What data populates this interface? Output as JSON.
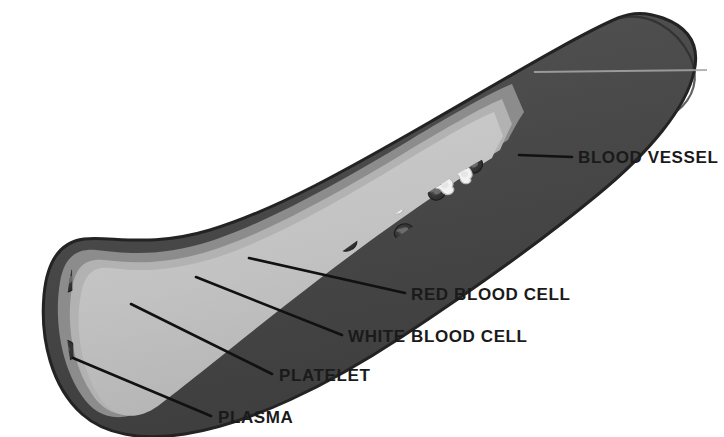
{
  "diagram": {
    "background_color": "#ffffff",
    "colors": {
      "vessel_wall_outer": "#4a4a4a",
      "vessel_wall_outline": "#2b2b2b",
      "vessel_wall_mid": "#8e8e8e",
      "vessel_wall_inner_ring": "#b0b0b0",
      "plasma_lumen": "#c2c2c2",
      "red_blood_cell": "#2d2d2d",
      "red_blood_cell_center": "#6e6e6e",
      "white_blood_cell": "#f2f2f2",
      "white_blood_cell_outline": "#b8b8b8",
      "platelet": "#555555",
      "label_text": "#1a1a1a",
      "leader_line": "#111111"
    },
    "labels": [
      {
        "id": "blood-vessel",
        "text": "BLOOD VESSEL",
        "text_x": 578,
        "text_y": 163,
        "anchor": "start",
        "leader": {
          "x1": 519,
          "y1": 155,
          "x2": 572,
          "y2": 157
        }
      },
      {
        "id": "red-blood-cell",
        "text": "RED BLOOD CELL",
        "text_x": 411,
        "text_y": 300,
        "anchor": "start",
        "leader": {
          "x1": 249,
          "y1": 258,
          "x2": 405,
          "y2": 293
        }
      },
      {
        "id": "white-blood-cell",
        "text": "WHITE BLOOD CELL",
        "text_x": 348,
        "text_y": 342,
        "anchor": "start",
        "leader": {
          "x1": 196,
          "y1": 277,
          "x2": 342,
          "y2": 335
        }
      },
      {
        "id": "platelet",
        "text": "PLATELET",
        "text_x": 279,
        "text_y": 381,
        "anchor": "start",
        "leader": {
          "x1": 131,
          "y1": 304,
          "x2": 272,
          "y2": 374
        }
      },
      {
        "id": "plasma",
        "text": "PLASMA",
        "text_x": 218,
        "text_y": 423,
        "anchor": "start",
        "leader": {
          "x1": 73,
          "y1": 358,
          "x2": 211,
          "y2": 416
        }
      }
    ],
    "cells": {
      "red_blood_cells": [
        {
          "cx": 32,
          "cy": 323,
          "rx": 15,
          "ry": 12,
          "rot": -22
        },
        {
          "cx": 66,
          "cy": 281,
          "rx": 14,
          "ry": 11,
          "rot": -18
        },
        {
          "cx": 63,
          "cy": 351,
          "rx": 13,
          "ry": 11,
          "rot": -10
        },
        {
          "cx": 101,
          "cy": 307,
          "rx": 13,
          "ry": 11,
          "rot": -14
        },
        {
          "cx": 97,
          "cy": 390,
          "rx": 13,
          "ry": 11,
          "rot": -6
        },
        {
          "cx": 155,
          "cy": 267,
          "rx": 12,
          "ry": 10,
          "rot": -20
        },
        {
          "cx": 170,
          "cy": 325,
          "rx": 12,
          "ry": 10,
          "rot": -8
        },
        {
          "cx": 231,
          "cy": 249,
          "rx": 11,
          "ry": 9,
          "rot": -24
        },
        {
          "cx": 249,
          "cy": 258,
          "rx": 10,
          "ry": 9,
          "rot": -16
        },
        {
          "cx": 296,
          "cy": 220,
          "rx": 11,
          "ry": 9,
          "rot": -26
        },
        {
          "cx": 345,
          "cy": 215,
          "rx": 10,
          "ry": 9,
          "rot": -24
        },
        {
          "cx": 347,
          "cy": 243,
          "rx": 10,
          "ry": 8,
          "rot": -18
        },
        {
          "cx": 392,
          "cy": 203,
          "rx": 10,
          "ry": 8,
          "rot": -28
        },
        {
          "cx": 404,
          "cy": 232,
          "rx": 10,
          "ry": 8,
          "rot": -22
        },
        {
          "cx": 437,
          "cy": 192,
          "rx": 9,
          "ry": 8,
          "rot": -30
        },
        {
          "cx": 449,
          "cy": 217,
          "rx": 9,
          "ry": 8,
          "rot": -26
        },
        {
          "cx": 474,
          "cy": 165,
          "rx": 9,
          "ry": 8,
          "rot": -32
        }
      ],
      "white_blood_cells": [
        {
          "cx": 35,
          "cy": 371,
          "r": 15,
          "rot": -18
        },
        {
          "cx": 47,
          "cy": 297,
          "r": 11,
          "rot": 12
        },
        {
          "cx": 106,
          "cy": 274,
          "r": 12,
          "rot": -14
        },
        {
          "cx": 137,
          "cy": 318,
          "r": 12,
          "rot": 8
        },
        {
          "cx": 196,
          "cy": 277,
          "r": 13,
          "rot": -10
        },
        {
          "cx": 254,
          "cy": 233,
          "r": 12,
          "rot": 14
        },
        {
          "cx": 327,
          "cy": 234,
          "r": 11,
          "rot": -12
        },
        {
          "cx": 395,
          "cy": 202,
          "r": 11,
          "rot": 10
        },
        {
          "cx": 444,
          "cy": 185,
          "r": 10,
          "rot": -16
        },
        {
          "cx": 464,
          "cy": 174,
          "r": 9,
          "rot": 6
        }
      ],
      "platelets": [
        {
          "cx": 84,
          "cy": 333,
          "s": 1.0,
          "rot": -12
        },
        {
          "cx": 34,
          "cy": 347,
          "s": 0.85,
          "rot": 20
        },
        {
          "cx": 113,
          "cy": 244,
          "s": 0.9,
          "rot": -30
        },
        {
          "cx": 131,
          "cy": 304,
          "s": 1.0,
          "rot": -8
        },
        {
          "cx": 199,
          "cy": 239,
          "s": 0.9,
          "rot": -22
        },
        {
          "cx": 281,
          "cy": 245,
          "s": 0.85,
          "rot": 70
        },
        {
          "cx": 295,
          "cy": 227,
          "s": 0.8,
          "rot": 62
        },
        {
          "cx": 375,
          "cy": 207,
          "s": 0.8,
          "rot": 68
        },
        {
          "cx": 437,
          "cy": 174,
          "s": 0.8,
          "rot": 64
        },
        {
          "cx": 457,
          "cy": 160,
          "s": 0.75,
          "rot": 58
        }
      ]
    }
  }
}
